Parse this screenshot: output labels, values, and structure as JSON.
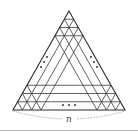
{
  "figure": {
    "type": "triangular-lattice",
    "apex": [
      69,
      11
    ],
    "bottom_left": [
      13,
      110
    ],
    "bottom_right": [
      125,
      110
    ],
    "subdivisions_shown_per_end": 3,
    "divisions_n": 12,
    "line_color": "#3a3a3a",
    "ellipsis_glyph": "…",
    "ellipses": [
      {
        "position": "left",
        "label": "..."
      },
      {
        "position": "right",
        "label": "..."
      },
      {
        "position": "bottom",
        "label": "..."
      }
    ],
    "brace_label": "n"
  }
}
